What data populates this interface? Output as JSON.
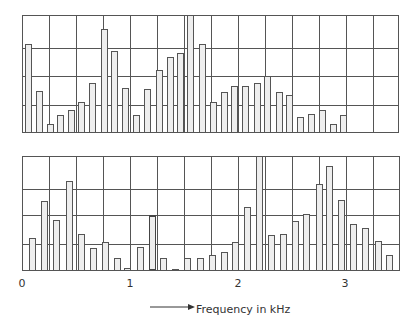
{
  "chart_data": [
    {
      "type": "bar",
      "name": "upper-spectrum",
      "title": "",
      "xlabel": "Frequency in kHz",
      "ylabel": "",
      "xlim": [
        0,
        3.5
      ],
      "ylim": [
        0,
        4
      ],
      "grid": true,
      "gridlines_y": 4,
      "gridlines_x_per_khz": 4,
      "x": [
        0.06,
        0.16,
        0.26,
        0.36,
        0.46,
        0.55,
        0.65,
        0.76,
        0.86,
        0.96,
        1.06,
        1.16,
        1.27,
        1.37,
        1.47,
        1.56,
        1.67,
        1.77,
        1.87,
        1.97,
        2.07,
        2.18,
        2.27,
        2.38,
        2.48,
        2.58,
        2.68,
        2.78,
        2.88,
        2.98
      ],
      "values": [
        3.0,
        1.4,
        0.25,
        0.55,
        0.75,
        1.0,
        1.65,
        3.5,
        2.75,
        1.5,
        0.55,
        1.45,
        2.1,
        2.55,
        2.7,
        4.0,
        3.0,
        1.0,
        1.35,
        1.55,
        1.55,
        1.65,
        1.9,
        1.35,
        1.25,
        0.5,
        0.6,
        0.75,
        0.25,
        0.55
      ]
    },
    {
      "type": "bar",
      "name": "lower-spectrum",
      "title": "",
      "xlabel": "Frequency in kHz",
      "ylabel": "",
      "xlim": [
        0,
        3.5
      ],
      "ylim": [
        0,
        4
      ],
      "grid": true,
      "gridlines_y": 4,
      "gridlines_x_per_khz": 4,
      "x": [
        0.1,
        0.21,
        0.32,
        0.44,
        0.55,
        0.66,
        0.77,
        0.88,
        0.98,
        1.1,
        1.21,
        1.31,
        1.42,
        1.53,
        1.65,
        1.76,
        1.87,
        1.98,
        2.09,
        2.2,
        2.31,
        2.42,
        2.53,
        2.63,
        2.75,
        2.85,
        2.96,
        3.07,
        3.18,
        3.3,
        3.4
      ],
      "values": [
        1.1,
        2.4,
        1.75,
        3.1,
        1.25,
        0.75,
        0.95,
        0.4,
        0.07,
        0.8,
        1.9,
        0.4,
        0.03,
        0.42,
        0.4,
        0.5,
        0.6,
        0.95,
        2.2,
        4.0,
        1.2,
        1.25,
        1.7,
        1.95,
        3.0,
        3.65,
        2.45,
        1.6,
        1.45,
        1.0,
        0.5
      ],
      "highlight_bars": [
        10
      ]
    }
  ],
  "axis": {
    "tick_labels": [
      "0",
      "1",
      "2",
      "3"
    ],
    "xlabel": "Frequency in kHz",
    "arrow": "→"
  }
}
